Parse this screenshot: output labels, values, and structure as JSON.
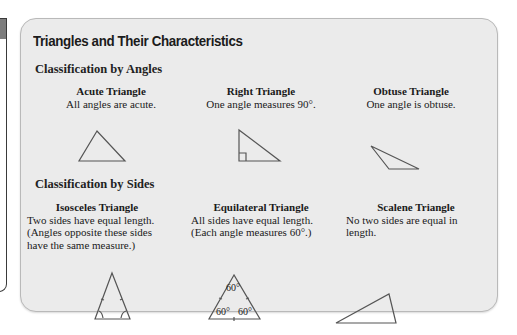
{
  "title": "Triangles and Their Characteristics",
  "sections": [
    {
      "heading": "Classification by Angles",
      "items": [
        {
          "name": "Acute Triangle",
          "desc": [
            "All angles are acute."
          ],
          "icon": "acute-triangle-icon"
        },
        {
          "name": "Right Triangle",
          "desc": [
            "One angle measures 90°."
          ],
          "icon": "right-triangle-icon"
        },
        {
          "name": "Obtuse Triangle",
          "desc": [
            "One angle is obtuse."
          ],
          "icon": "obtuse-triangle-icon"
        }
      ]
    },
    {
      "heading": "Classification by Sides",
      "items": [
        {
          "name": "Isosceles Triangle",
          "desc": [
            "Two sides have equal length.",
            "(Angles opposite these sides",
            "have the same measure.)"
          ],
          "icon": "isosceles-triangle-icon"
        },
        {
          "name": "Equilateral Triangle",
          "desc": [
            "All sides have equal length.",
            "(Each angle measures 60°.)"
          ],
          "icon": "equilateral-triangle-icon",
          "angle_labels": [
            "60°",
            "60°",
            "60°"
          ]
        },
        {
          "name": "Scalene Triangle",
          "desc": [
            "No two sides are equal in",
            "length."
          ],
          "icon": "scalene-triangle-icon"
        }
      ]
    }
  ]
}
